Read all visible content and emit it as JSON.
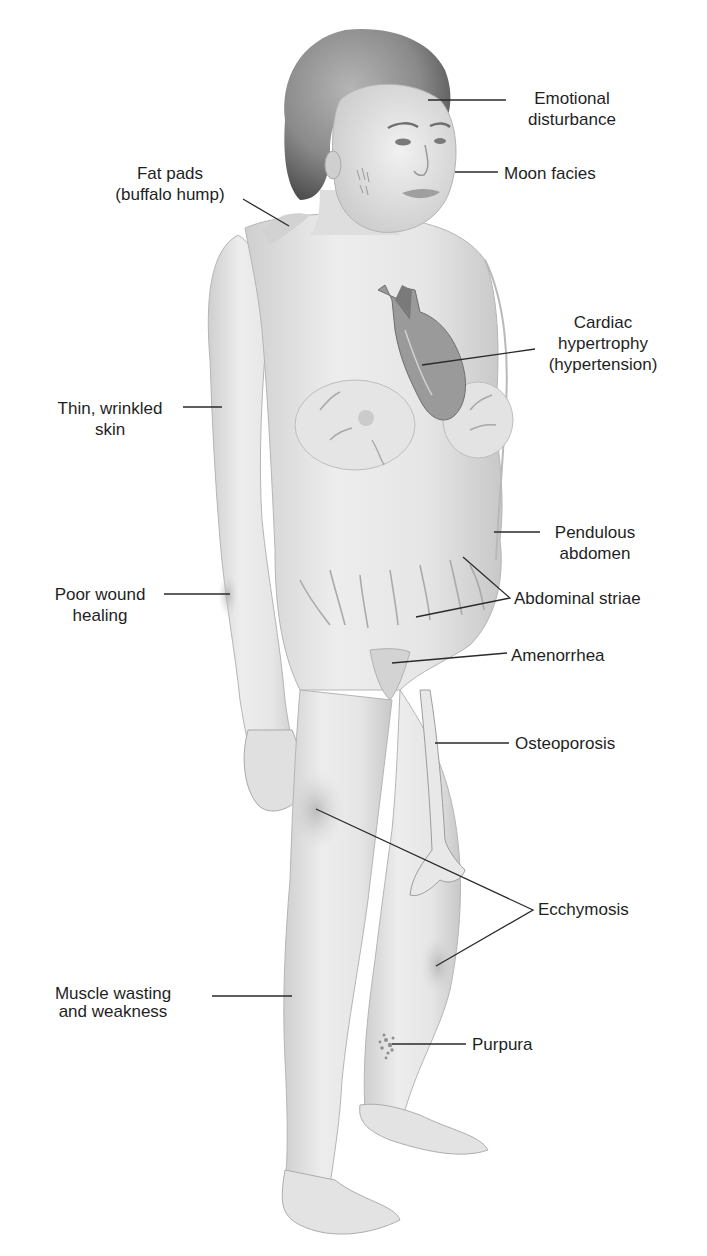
{
  "diagram": {
    "palette": {
      "background": "#ffffff",
      "skin_light": "#efefef",
      "skin_mid": "#d9d9d9",
      "skin_shadow": "#b8b8b8",
      "hair": "#8a8a8a",
      "hair_dark": "#5a5a5a",
      "heart": "#8c8c8c",
      "leader_line": "#2a2a2a",
      "text": "#1f1f1f"
    },
    "labels": [
      {
        "id": "emotional-disturbance",
        "lines": [
          "Emotional",
          "disturbance"
        ],
        "align": "center",
        "x": 512,
        "y": 88,
        "line": [
          [
            428,
            100
          ],
          [
            506,
            100
          ]
        ]
      },
      {
        "id": "moon-facies",
        "lines": [
          "Moon facies"
        ],
        "align": "left",
        "x": 504,
        "y": 163,
        "line": [
          [
            455,
            172
          ],
          [
            498,
            172
          ]
        ]
      },
      {
        "id": "fat-pads",
        "lines": [
          "Fat pads",
          "(buffalo hump)"
        ],
        "align": "center",
        "x": 100,
        "y": 163,
        "line": [
          [
            243,
            199
          ],
          [
            289,
            226
          ]
        ]
      },
      {
        "id": "cardiac-hypertrophy",
        "lines": [
          "Cardiac",
          "hypertrophy",
          "(hypertension)"
        ],
        "align": "center",
        "x": 533,
        "y": 312,
        "line": [
          [
            422,
            365
          ],
          [
            535,
            349
          ]
        ]
      },
      {
        "id": "thin-wrinkled-skin",
        "lines": [
          "Thin, wrinkled",
          "skin"
        ],
        "align": "center",
        "x": 45,
        "y": 399,
        "line": [
          [
            183,
            407
          ],
          [
            222,
            407
          ]
        ]
      },
      {
        "id": "pendulous-abdomen",
        "lines": [
          "Pendulous",
          "abdomen"
        ],
        "align": "center",
        "x": 547,
        "y": 525,
        "line": [
          [
            494,
            532
          ],
          [
            540,
            532
          ]
        ]
      },
      {
        "id": "abdominal-striae",
        "lines": [
          "Abdominal striae"
        ],
        "align": "left",
        "x": 515,
        "y": 590,
        "line": [
          [
            463,
            557
          ],
          [
            510,
            598
          ],
          [
            416,
            617
          ]
        ]
      },
      {
        "id": "poor-wound-healing",
        "lines": [
          "Poor wound",
          "healing"
        ],
        "align": "center",
        "x": 45,
        "y": 585,
        "line": [
          [
            164,
            594
          ],
          [
            230,
            594
          ]
        ]
      },
      {
        "id": "amenorrhea",
        "lines": [
          "Amenorrhea"
        ],
        "align": "left",
        "x": 512,
        "y": 647,
        "line": [
          [
            392,
            663
          ],
          [
            507,
            653
          ]
        ]
      },
      {
        "id": "osteoporosis",
        "lines": [
          "Osteoporosis"
        ],
        "align": "left",
        "x": 516,
        "y": 735,
        "line": [
          [
            435,
            743
          ],
          [
            509,
            743
          ]
        ]
      },
      {
        "id": "ecchymosis",
        "lines": [
          "Ecchymosis"
        ],
        "align": "left",
        "x": 538,
        "y": 901,
        "line": [
          [
            316,
            809
          ],
          [
            533,
            910
          ],
          [
            436,
            966
          ]
        ]
      },
      {
        "id": "muscle-wasting",
        "lines": [
          "Muscle wasting",
          "and weakness"
        ],
        "align": "center",
        "x": 22,
        "y": 986,
        "line": [
          [
            212,
            996
          ],
          [
            292,
            996
          ]
        ]
      },
      {
        "id": "purpura",
        "lines": [
          "Purpura"
        ],
        "align": "left",
        "x": 473,
        "y": 1035,
        "line": [
          [
            392,
            1044
          ],
          [
            466,
            1044
          ]
        ]
      }
    ]
  }
}
